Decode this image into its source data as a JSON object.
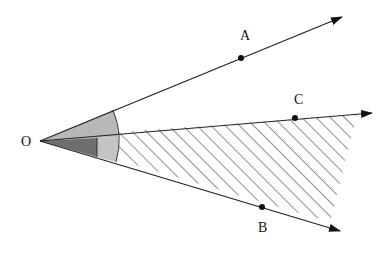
{
  "diagram": {
    "type": "angle-rays",
    "origin": {
      "label": "O",
      "x": 40,
      "y": 141
    },
    "rays": [
      {
        "name": "OA",
        "point_label": "A",
        "point": {
          "x": 241,
          "y": 58
        },
        "tip": {
          "x": 342,
          "y": 17
        },
        "label_pos": {
          "x": 240,
          "y": 40
        }
      },
      {
        "name": "OC",
        "point_label": "C",
        "point": {
          "x": 295,
          "y": 118
        },
        "tip": {
          "x": 372,
          "y": 113
        },
        "label_pos": {
          "x": 294,
          "y": 104
        }
      },
      {
        "name": "OB",
        "point_label": "B",
        "point": {
          "x": 262,
          "y": 207
        },
        "tip": {
          "x": 340,
          "y": 231
        },
        "label_pos": {
          "x": 258,
          "y": 232
        }
      }
    ],
    "regions": [
      {
        "name": "angle-AOC-sector",
        "fill": "#b8b8b8"
      },
      {
        "name": "angle-COB-inner-dark",
        "fill": "#6e6e6e"
      },
      {
        "name": "angle-COB-inner-light",
        "fill": "#c4c4c4"
      },
      {
        "name": "angle-COB-hatched",
        "pattern": "diagonal-hatch"
      }
    ],
    "colors": {
      "line": "#222222",
      "hatch": "#555555"
    }
  }
}
